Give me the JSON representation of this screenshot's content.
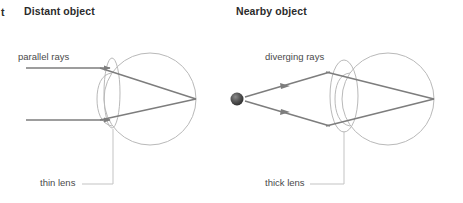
{
  "figure": {
    "edge_fragment": "t",
    "panels": [
      {
        "id": "distant",
        "title": "Distant object",
        "ray_label": "parallel rays",
        "lens_label": "thin lens"
      },
      {
        "id": "nearby",
        "title": "Nearby object",
        "ray_label": "diverging rays",
        "lens_label": "thick lens"
      }
    ],
    "colors": {
      "eyeball_outline": "#b9b9b9",
      "lens_outline": "#b9b9b9",
      "ray_line": "#7d7d7d",
      "leader_line": "#c3c3c3",
      "object_sphere": "#4a4a4a",
      "title_text": "#2b2b2b",
      "label_text": "#4a4a4a",
      "background": "#ffffff"
    }
  }
}
